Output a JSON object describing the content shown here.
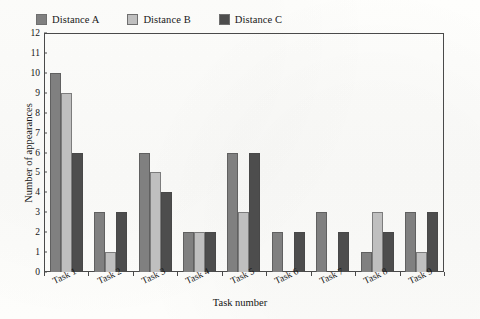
{
  "chart_data": {
    "type": "bar",
    "title": "",
    "categories": [
      "Task 1",
      "Task 2",
      "Task 3",
      "Task 4",
      "Task 5",
      "Task 6",
      "Task 7",
      "Task 8",
      "Task 9"
    ],
    "series": [
      {
        "name": "Distance A",
        "color": "#808080",
        "values": [
          10,
          3,
          6,
          2,
          6,
          2,
          3,
          1,
          3
        ]
      },
      {
        "name": "Distance B",
        "color": "#bfbfbf",
        "values": [
          9,
          1,
          5,
          2,
          3,
          0,
          0,
          3,
          1
        ]
      },
      {
        "name": "Distance C",
        "color": "#4d4d4d",
        "values": [
          6,
          3,
          4,
          2,
          6,
          2,
          2,
          2,
          3
        ]
      }
    ],
    "xlabel": "Task number",
    "ylabel": "Number of appearances",
    "ylim": [
      0,
      12
    ],
    "ytick_step": 1,
    "yticks": [
      "12",
      "11",
      "10",
      "9",
      "8",
      "7",
      "6",
      "5",
      "4",
      "3",
      "2",
      "1",
      "0"
    ],
    "grid": false,
    "legend_position": "top-left",
    "frame": true
  }
}
